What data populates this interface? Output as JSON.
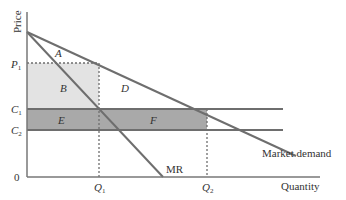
{
  "diagram": {
    "axes": {
      "y_label": "Price",
      "x_label": "Quantity",
      "origin_label": "0"
    },
    "price_levels": [
      {
        "id": "P1",
        "base": "P",
        "sub": "1"
      },
      {
        "id": "C1",
        "base": "C",
        "sub": "1"
      },
      {
        "id": "C2",
        "base": "C",
        "sub": "2"
      }
    ],
    "quantity_levels": [
      {
        "id": "Q1",
        "base": "Q",
        "sub": "1"
      },
      {
        "id": "Q2",
        "base": "Q",
        "sub": "2"
      }
    ],
    "curves": {
      "demand": "Market demand",
      "mr": "MR"
    },
    "areas": {
      "A": "A",
      "B": "B",
      "D": "D",
      "E": "E",
      "F": "F"
    },
    "colors": {
      "light_shade": "#e3e3e3",
      "dark_shade": "#a9a9a9",
      "line": "#6e6e6e",
      "axis": "#777777",
      "text": "#333333"
    }
  }
}
